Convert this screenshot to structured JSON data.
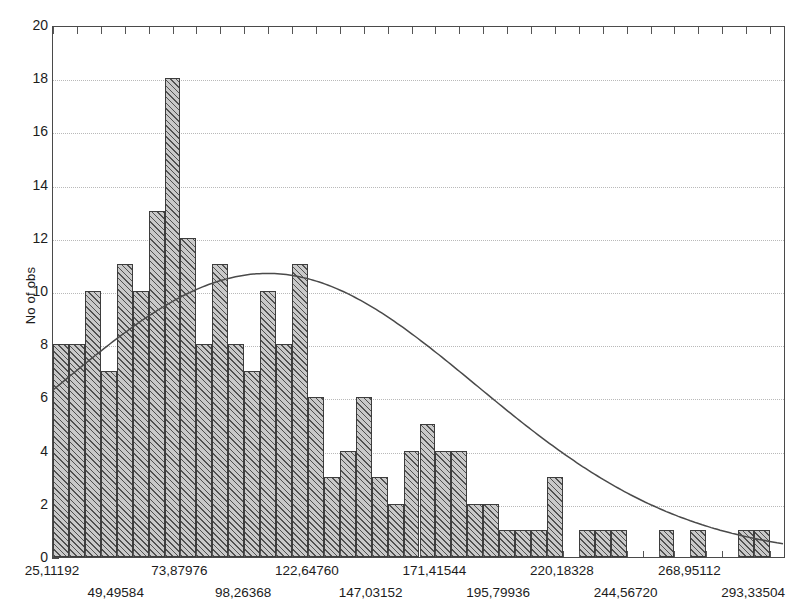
{
  "chart_data": {
    "type": "bar",
    "title": "",
    "subtitle": "",
    "xlabel": "",
    "ylabel": "No of obs",
    "ylim": [
      0,
      20
    ],
    "ytick_values": [
      0,
      2,
      4,
      6,
      8,
      10,
      12,
      14,
      16,
      18,
      20
    ],
    "grid": true,
    "legend": false,
    "legend_position": "none",
    "bin_width": 24.38392,
    "x_first_label": 25.11192,
    "x_label_step": 24.38392,
    "xtick_labels": [
      "25,11192",
      "49,49584",
      "73,87976",
      "98,26368",
      "122,64760",
      "147,03152",
      "171,41544",
      "195,79936",
      "220,18328",
      "244,56720",
      "268,95112",
      "293,33504"
    ],
    "xtick_rows": [
      0,
      1,
      0,
      1,
      0,
      1,
      0,
      1,
      0,
      1,
      0,
      1
    ],
    "categories": [
      "bin-01",
      "bin-02",
      "bin-03",
      "bin-04",
      "bin-05",
      "bin-06",
      "bin-07",
      "bin-08",
      "bin-09",
      "bin-10",
      "bin-11",
      "bin-12",
      "bin-13",
      "bin-14",
      "bin-15",
      "bin-16",
      "bin-17",
      "bin-18",
      "bin-19",
      "bin-20",
      "bin-21",
      "bin-22",
      "bin-23",
      "bin-24",
      "bin-25",
      "bin-26",
      "bin-27",
      "bin-28",
      "bin-29",
      "bin-30",
      "bin-31",
      "bin-32",
      "bin-33",
      "bin-34",
      "bin-35",
      "bin-36",
      "bin-37",
      "bin-38",
      "bin-39",
      "bin-40",
      "bin-41",
      "bin-42",
      "bin-43",
      "bin-44",
      "bin-45",
      "bin-46"
    ],
    "values": [
      8,
      8,
      10,
      7,
      11,
      10,
      13,
      18,
      12,
      8,
      11,
      8,
      7,
      10,
      8,
      11,
      6,
      3,
      4,
      6,
      3,
      2,
      4,
      5,
      4,
      4,
      2,
      2,
      1,
      1,
      1,
      3,
      0,
      1,
      1,
      1,
      0,
      0,
      1,
      0,
      1,
      0,
      0,
      1,
      1,
      0
    ],
    "overlay": {
      "name": "normal-fit-curve",
      "type": "line",
      "color": "#4a4a4a",
      "peak_value": 10.7,
      "peak_bin_index": 13,
      "start_value": 6.3,
      "end_value": 0.15
    },
    "series_style": {
      "bar_fill": "#c9c9c9",
      "bar_hatch": "diagonal-45",
      "bar_edge": "#3d3d3d"
    }
  }
}
